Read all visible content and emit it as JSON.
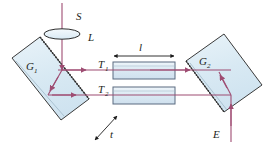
{
  "figure": {
    "background_color": "#ffffff",
    "width": 275,
    "height": 150
  },
  "colors": {
    "beam": "#9e4c72",
    "beam_alt": "#a34f77",
    "glass_fill": "#dcebf3",
    "glass_fill_light": "#e8f2f8",
    "glass_stroke": "#3a3a3a",
    "tube_fill": "#dbe9f3",
    "tube_stroke": "#5a6b80",
    "dimension_line": "#1b1b1b",
    "text": "#231f20"
  },
  "labels": {
    "source": {
      "text": "S",
      "x": 76,
      "y": 17
    },
    "lens": {
      "text": "L",
      "x": 88,
      "y": 40
    },
    "plate_left": {
      "base": "G",
      "sub": "1",
      "x": 27,
      "y": 68
    },
    "plate_right": {
      "base": "G",
      "sub": "2",
      "x": 200,
      "y": 63
    },
    "tube_top": {
      "base": "T",
      "sub": "1",
      "x": 101,
      "y": 67
    },
    "tube_bottom": {
      "base": "T",
      "sub": "2",
      "x": 101,
      "y": 92
    },
    "length": {
      "text": "l",
      "x": 139,
      "y": 50
    },
    "thickness": {
      "text": "t",
      "x": 110,
      "y": 136
    },
    "eye": {
      "text": "E",
      "x": 231,
      "y": 135
    }
  },
  "elements": {
    "lens": {
      "name": "converging-lens",
      "cx": 62,
      "cy": 34,
      "rx": 18,
      "ry": 5
    },
    "plate_g1": {
      "name": "beam-splitter-plate-1",
      "points": "12,58 40,37 89,99 61,120"
    },
    "plate_g2": {
      "name": "beam-splitter-plate-2",
      "points": "186,61 224,34 262,85 224,112"
    },
    "tube_t1": {
      "name": "gas-tube-1",
      "x": 113,
      "y": 62,
      "w": 62,
      "h": 17
    },
    "tube_t2": {
      "name": "gas-tube-2",
      "x": 113,
      "y": 87,
      "w": 62,
      "h": 17
    }
  },
  "beams": {
    "source_ray": {
      "from": [
        62,
        4
      ],
      "to": [
        62,
        70
      ]
    },
    "upper_path": {
      "from": [
        62,
        70
      ],
      "to": [
        231,
        70
      ]
    },
    "internal_reflect": {
      "from": [
        62,
        70
      ],
      "to": [
        48,
        95
      ]
    },
    "lower_path": {
      "from": [
        48,
        95
      ],
      "to": [
        231,
        95
      ]
    },
    "output_ray": {
      "from": [
        231,
        95
      ],
      "to": [
        231,
        143
      ]
    },
    "recombine": {
      "from": [
        231,
        95
      ],
      "to": [
        231,
        70
      ]
    }
  },
  "dimension": {
    "length_line": {
      "x1": 113,
      "x2": 175,
      "y": 56
    },
    "thickness_line": {
      "x1": 97,
      "y1": 138,
      "x2": 119,
      "y2": 117
    }
  }
}
